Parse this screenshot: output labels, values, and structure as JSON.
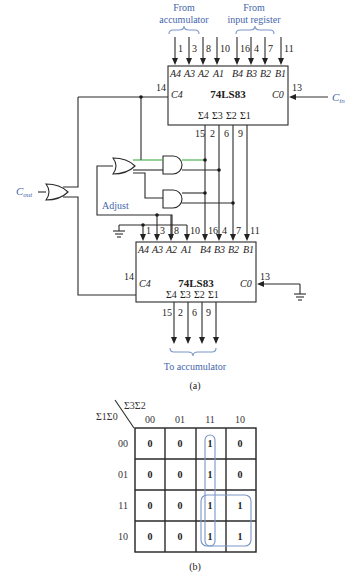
{
  "figure_a": {
    "caption": "(a)",
    "top_labels": {
      "accumulator_line1": "From",
      "accumulator_line2": "accumulator",
      "input_line1": "From",
      "input_line2": "input register"
    },
    "top_chip": {
      "name": "74LS83",
      "a_pins": [
        "1",
        "3",
        "8",
        "10"
      ],
      "b_pins": [
        "16",
        "4",
        "7",
        "11"
      ],
      "a_labels": [
        "A4",
        "A3",
        "A2",
        "A1"
      ],
      "b_labels": [
        "B4",
        "B3",
        "B2",
        "B1"
      ],
      "sum_labels": [
        "Σ4",
        "Σ3",
        "Σ2",
        "Σ1"
      ],
      "sum_pins": [
        "15",
        "2",
        "6",
        "9"
      ],
      "c4_label": "C4",
      "c4_pin": "14",
      "c0_label": "C0",
      "c0_pin": "13",
      "cin_label": "C",
      "cin_sub": "in"
    },
    "cout_label": "C",
    "cout_sub": "out",
    "adjust_label": "Adjust",
    "bottom_chip": {
      "name": "74LS83",
      "a_pins": [
        "1",
        "3",
        "8",
        "10"
      ],
      "b_pins": [
        "16",
        "4",
        "7",
        "11"
      ],
      "a_labels": [
        "A4",
        "A3",
        "A2",
        "A1"
      ],
      "b_labels": [
        "B4",
        "B3",
        "B2",
        "B1"
      ],
      "sum_labels": [
        "Σ4",
        "Σ3",
        "Σ2",
        "Σ1"
      ],
      "sum_pins": [
        "15",
        "2",
        "6",
        "9"
      ],
      "c4_label": "C4",
      "c4_pin": "14",
      "c0_label": "C0",
      "c0_pin": "13"
    },
    "output_label": "To accumulator"
  },
  "figure_b": {
    "caption": "(b)",
    "col_var": "Σ3Σ2",
    "row_var": "Σ1Σ0",
    "col_headers": [
      "00",
      "01",
      "11",
      "10"
    ],
    "row_headers": [
      "00",
      "01",
      "11",
      "10"
    ],
    "cells": [
      [
        "0",
        "0",
        "1",
        "0"
      ],
      [
        "0",
        "0",
        "1",
        "0"
      ],
      [
        "0",
        "0",
        "1",
        "1"
      ],
      [
        "0",
        "0",
        "1",
        "1"
      ]
    ],
    "groupings": [
      "column 11 (all rows)",
      "rows 11 & 10 × columns 11 & 10"
    ]
  }
}
